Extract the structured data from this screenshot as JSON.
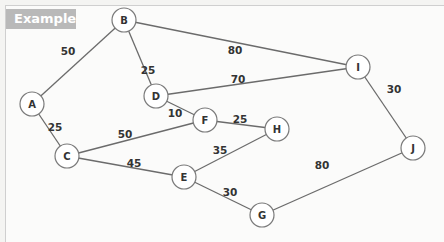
{
  "header": {
    "tag_label": "Example"
  },
  "graph": {
    "nodes": [
      {
        "id": "A",
        "x": 32,
        "y": 104
      },
      {
        "id": "B",
        "x": 124,
        "y": 20
      },
      {
        "id": "C",
        "x": 67,
        "y": 156
      },
      {
        "id": "D",
        "x": 156,
        "y": 96
      },
      {
        "id": "E",
        "x": 184,
        "y": 177
      },
      {
        "id": "F",
        "x": 205,
        "y": 120
      },
      {
        "id": "G",
        "x": 262,
        "y": 215
      },
      {
        "id": "H",
        "x": 277,
        "y": 129
      },
      {
        "id": "I",
        "x": 358,
        "y": 67
      },
      {
        "id": "J",
        "x": 413,
        "y": 148
      }
    ],
    "edges": [
      {
        "from": "A",
        "to": "B",
        "weight": "50",
        "lx": 68,
        "ly": 51
      },
      {
        "from": "A",
        "to": "C",
        "weight": "25",
        "lx": 55,
        "ly": 127
      },
      {
        "from": "B",
        "to": "D",
        "weight": "25",
        "lx": 148,
        "ly": 70
      },
      {
        "from": "B",
        "to": "I",
        "weight": "80",
        "lx": 235,
        "ly": 50
      },
      {
        "from": "D",
        "to": "I",
        "weight": "70",
        "lx": 238,
        "ly": 79
      },
      {
        "from": "D",
        "to": "F",
        "weight": "10",
        "lx": 175,
        "ly": 113
      },
      {
        "from": "C",
        "to": "F",
        "weight": "50",
        "lx": 125,
        "ly": 134
      },
      {
        "from": "F",
        "to": "H",
        "weight": "25",
        "lx": 240,
        "ly": 119
      },
      {
        "from": "C",
        "to": "E",
        "weight": "45",
        "lx": 134,
        "ly": 163
      },
      {
        "from": "E",
        "to": "H",
        "weight": "35",
        "lx": 220,
        "ly": 150
      },
      {
        "from": "E",
        "to": "G",
        "weight": "30",
        "lx": 230,
        "ly": 192
      },
      {
        "from": "G",
        "to": "J",
        "weight": "80",
        "lx": 322,
        "ly": 165
      },
      {
        "from": "I",
        "to": "J",
        "weight": "30",
        "lx": 394,
        "ly": 89
      }
    ]
  }
}
